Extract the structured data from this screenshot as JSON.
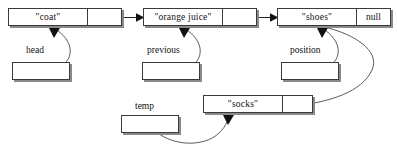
{
  "diagram": {
    "nodes": [
      {
        "id": "coat",
        "data": "\"coat\"",
        "pointer": "",
        "x": 8,
        "y": 8,
        "w": 114,
        "h": 18,
        "ptr_w": 34
      },
      {
        "id": "orange-juice",
        "data": "\"orange juice\"",
        "pointer": "",
        "x": 143,
        "y": 8,
        "w": 114,
        "h": 18,
        "ptr_w": 34
      },
      {
        "id": "shoes",
        "data": "\"shoes\"",
        "pointer": "null",
        "x": 277,
        "y": 8,
        "w": 114,
        "h": 18,
        "ptr_w": 34
      },
      {
        "id": "socks",
        "data": "\"socks\"",
        "pointer": "",
        "x": 203,
        "y": 95,
        "w": 110,
        "h": 18,
        "ptr_w": 30
      }
    ],
    "variables": [
      {
        "id": "head",
        "label": "head",
        "label_x": 26,
        "label_y": 45,
        "box_x": 12,
        "box_y": 62,
        "box_w": 58,
        "box_h": 18
      },
      {
        "id": "previous",
        "label": "previous",
        "label_x": 147,
        "label_y": 45,
        "box_x": 142,
        "box_y": 62,
        "box_w": 58,
        "box_h": 18
      },
      {
        "id": "position",
        "label": "position",
        "label_x": 290,
        "label_y": 45,
        "box_x": 281,
        "box_y": 62,
        "box_w": 58,
        "box_h": 18
      },
      {
        "id": "temp",
        "label": "temp",
        "label_x": 135,
        "label_y": 101,
        "box_x": 121,
        "box_y": 115,
        "box_w": 58,
        "box_h": 18
      }
    ],
    "colors": {
      "box_border": "#3a3a3a",
      "box_shadow": "#8a8a8a",
      "wire": "#4a4a4a",
      "arrowhead": "#111111",
      "background": "#ffffff",
      "text": "#111111"
    },
    "connections": [
      {
        "id": "coat-to-orange-juice",
        "from": "coat.pointer",
        "to": "orange-juice.node",
        "style": "straight-arrow"
      },
      {
        "id": "orange-juice-to-shoes",
        "from": "orange-juice.pointer",
        "to": "shoes.node",
        "style": "straight-arrow"
      },
      {
        "id": "head-to-coat",
        "from": "head.box",
        "to": "coat.node",
        "style": "curve-up-arrow"
      },
      {
        "id": "previous-to-orange-juice",
        "from": "previous.box",
        "to": "orange-juice.node",
        "style": "curve-up-arrow"
      },
      {
        "id": "position-to-shoes",
        "from": "position.box",
        "to": "shoes.node",
        "style": "curve-up-arrow"
      },
      {
        "id": "socks-to-shoes",
        "from": "socks.pointer",
        "to": "shoes.node",
        "style": "curve-up-arrow"
      },
      {
        "id": "temp-to-socks",
        "from": "temp.box",
        "to": "socks.node",
        "style": "curve-up-arrow"
      }
    ]
  }
}
